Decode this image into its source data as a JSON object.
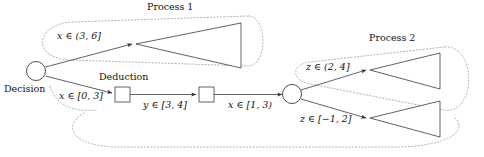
{
  "diagram": {
    "type": "flow-diagram",
    "background": "#ffffff",
    "stroke_color": "#3a3a3a",
    "enclosure_color": "#9a9a9a",
    "groups": [
      {
        "id": "process-1",
        "label": "Process 1"
      },
      {
        "id": "process-2",
        "label": "Process 2"
      }
    ],
    "nodes": [
      {
        "id": "decision",
        "shape": "circle",
        "label": "Decision"
      },
      {
        "id": "deduction",
        "shape": "square",
        "label": "Deduction"
      },
      {
        "id": "state-2",
        "shape": "square",
        "label": ""
      },
      {
        "id": "junction",
        "shape": "circle",
        "label": ""
      },
      {
        "id": "triangle-p1",
        "shape": "triangle-left",
        "label": ""
      },
      {
        "id": "triangle-p2-upper",
        "shape": "triangle-left",
        "label": ""
      },
      {
        "id": "triangle-p2-lower",
        "shape": "triangle-left",
        "label": ""
      }
    ],
    "edges": [
      {
        "id": "edge-x-3-6",
        "from": "decision",
        "to": "triangle-p1",
        "label": "x ∈ (3, 6]"
      },
      {
        "id": "edge-x-0-3",
        "from": "decision",
        "to": "deduction",
        "label": "x ∈ [0, 3]"
      },
      {
        "id": "edge-y-3-4",
        "from": "deduction",
        "to": "state-2",
        "label": "y ∈ [3, 4]"
      },
      {
        "id": "edge-x-1-3",
        "from": "state-2",
        "to": "junction",
        "label": "x ∈ [1, 3)"
      },
      {
        "id": "edge-z-2-4",
        "from": "junction",
        "to": "triangle-p2-upper",
        "label": "z ∈ (2, 4]"
      },
      {
        "id": "edge-z-m1-2",
        "from": "junction",
        "to": "triangle-p2-lower",
        "label": "z ∈ [−1, 2]"
      }
    ]
  }
}
